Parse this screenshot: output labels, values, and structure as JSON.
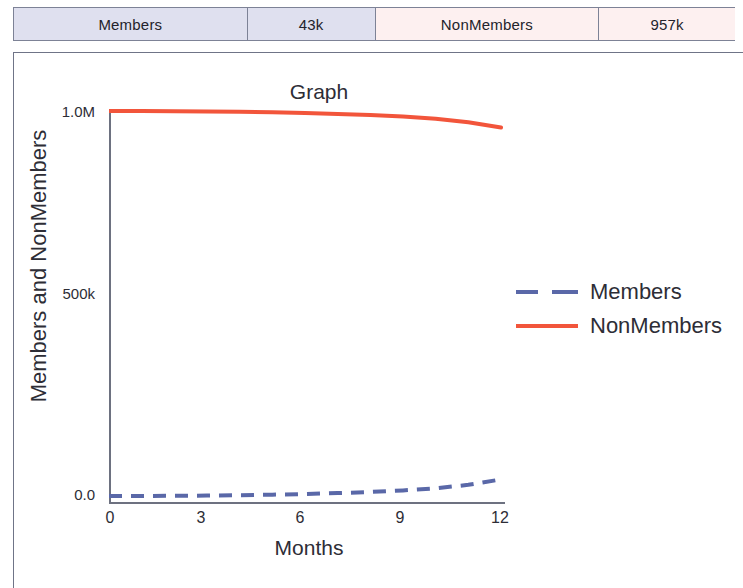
{
  "summary_table": {
    "cells": [
      {
        "label": "Members",
        "kind": "label",
        "group": "members"
      },
      {
        "label": "43k",
        "kind": "value",
        "group": "members"
      },
      {
        "label": "NonMembers",
        "kind": "label",
        "group": "nonmembers"
      },
      {
        "label": "957k",
        "kind": "value",
        "group": "nonmembers"
      }
    ]
  },
  "colors": {
    "members_line": "#5a68a8",
    "nonmembers_line": "#f2553b",
    "axis": "#6d7180",
    "members_cell_bg": "#dfe0ef",
    "nonmembers_cell_bg": "#fdf0f0",
    "text": "#2d2d36"
  },
  "chart_data": {
    "type": "line",
    "title": "Graph",
    "xlabel": "Months",
    "ylabel": "Members and NonMembers",
    "xlim": [
      0,
      12
    ],
    "ylim": [
      0,
      1100000
    ],
    "xticks": [
      0,
      3,
      6,
      9,
      12
    ],
    "xtick_labels": [
      "0",
      "3",
      "6",
      "9",
      "12"
    ],
    "yticks": [
      0,
      500000,
      1000000
    ],
    "ytick_labels": [
      "0.0",
      "500k",
      "1.0M"
    ],
    "grid": false,
    "legend_position": "right-middle",
    "series": [
      {
        "name": "Members",
        "color": "#5a68a8",
        "style": "dashed",
        "x": [
          0,
          1,
          2,
          3,
          4,
          5,
          6,
          7,
          8,
          9,
          10,
          11,
          12
        ],
        "values": [
          0,
          200,
          500,
          1100,
          2200,
          3500,
          5200,
          7500,
          10500,
          14500,
          20000,
          29000,
          43000
        ]
      },
      {
        "name": "NonMembers",
        "color": "#f2553b",
        "style": "solid",
        "x": [
          0,
          1,
          2,
          3,
          4,
          5,
          6,
          7,
          8,
          9,
          10,
          11,
          12
        ],
        "values": [
          1000000,
          999800,
          999500,
          998900,
          997800,
          996500,
          994800,
          992500,
          989500,
          985500,
          980000,
          971000,
          957000
        ]
      }
    ]
  },
  "legend": {
    "entries": [
      {
        "label": "Members",
        "color": "#5a68a8",
        "style": "dashed"
      },
      {
        "label": "NonMembers",
        "color": "#f2553b",
        "style": "solid"
      }
    ]
  }
}
